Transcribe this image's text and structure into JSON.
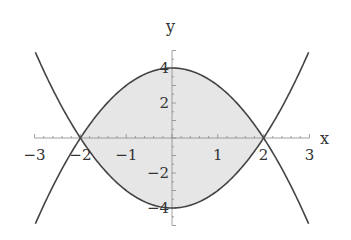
{
  "chart_data": {
    "type": "line",
    "title": "",
    "xlabel": "x",
    "ylabel": "y",
    "xlim": [
      -3,
      3
    ],
    "ylim": [
      -5,
      5
    ],
    "grid": false,
    "series": [
      {
        "name": "upper",
        "formula": "y = 4 - x^2"
      },
      {
        "name": "lower",
        "formula": "y = x^2 - 4"
      }
    ],
    "shaded_region": {
      "between": [
        "upper",
        "lower"
      ],
      "x_range": [
        -2,
        2
      ],
      "color": "#e6e6e6"
    },
    "x_ticks": [
      {
        "value": -3,
        "label": "−3"
      },
      {
        "value": -2,
        "label": "−2"
      },
      {
        "value": -1,
        "label": "−1"
      },
      {
        "value": 1,
        "label": "1"
      },
      {
        "value": 2,
        "label": "2"
      },
      {
        "value": 3,
        "label": "3"
      }
    ],
    "y_ticks": [
      {
        "value": 4,
        "label": "4"
      },
      {
        "value": 2,
        "label": "2"
      },
      {
        "value": -2,
        "label": "−2"
      },
      {
        "value": -4,
        "label": "−4"
      }
    ],
    "colors": {
      "curve": "#444444",
      "fill": "#e6e6e6",
      "axis": "#888888"
    }
  }
}
